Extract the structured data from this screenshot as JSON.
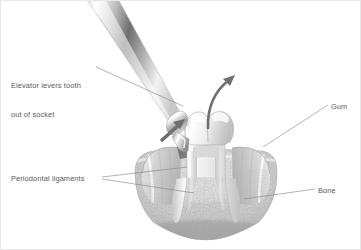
{
  "figure": {
    "kind": "medical-illustration",
    "style": "grayscale pencil/airbrush rendering",
    "background_color": "#ffffff",
    "line_color": "#58585a",
    "width": 361,
    "height": 250
  },
  "labels": {
    "elevator": {
      "text": "Elevator levers tooth\nout of socket",
      "line1": "Elevator levers tooth",
      "line2": "out of socket",
      "position": "left-top"
    },
    "periodontal": {
      "text": "Periodontal ligaments",
      "position": "left-bottom",
      "leader_count": 2
    },
    "gum": {
      "text": "Gum",
      "position": "right-top"
    },
    "bone": {
      "text": "Bone",
      "position": "right-bottom"
    }
  },
  "anatomy": {
    "tooth": {
      "name": "molar",
      "parts": [
        "crown",
        "cusps",
        "neck",
        "mesial root",
        "distal root",
        "pulp chamber"
      ],
      "roots": 2,
      "fill": "#f2f2f2"
    },
    "bone": {
      "name": "alveolar bone",
      "texture": "speckled trabecular",
      "fill": "#d8d8d8"
    },
    "gum": {
      "name": "gingiva",
      "lobes": [
        "left flap",
        "right flap"
      ],
      "fill": "#e0e0e0"
    },
    "ligaments": {
      "name": "periodontal ligaments",
      "location": "between root surface and bone socket"
    }
  },
  "instrument": {
    "name": "dental elevator",
    "orientation": "upper-left to lower-right diagonal",
    "parts": [
      "shaft",
      "collar",
      "blade tip"
    ],
    "material": "polished steel",
    "tip_location": "mesial socket of molar"
  },
  "arrows": {
    "lever": {
      "name": "lever-force-arrow",
      "direction": "up and to the right",
      "color": "#6f6f6f",
      "shape": "straight"
    },
    "rotation": {
      "name": "tooth-rotation-arrow",
      "direction": "sweeping up and to the right out of socket",
      "color": "#6f6f6f",
      "shape": "curved"
    }
  }
}
